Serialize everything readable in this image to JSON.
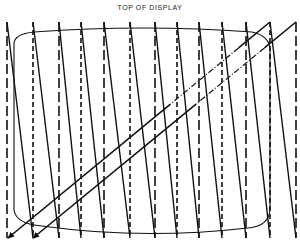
{
  "diagram": {
    "title": "TOP OF DISPLAY",
    "colors": {
      "line": "#111111",
      "background": "#ffffff"
    },
    "display_outline": {
      "shape": "rounded-rectangle",
      "x": 14,
      "y": 26,
      "width": 256,
      "height": 204,
      "rx": 10
    },
    "scan": {
      "top_y": 22,
      "bottom_y": 238,
      "verticals_x": [
        7,
        33,
        59,
        81,
        104,
        130,
        155,
        177,
        199,
        222,
        246,
        270,
        296
      ],
      "vertical_style": "dashed (retrace, blanked)",
      "trace_style": "solid (active scan)"
    },
    "vertical_retrace": [
      {
        "from": [
          270,
          22
        ],
        "to": [
          8,
          238
        ],
        "style": "solid with dash-dot segment",
        "arrow": "end"
      },
      {
        "from": [
          296,
          22
        ],
        "to": [
          33,
          238
        ],
        "style": "solid with dash-dot segment",
        "arrow": "end"
      }
    ]
  }
}
